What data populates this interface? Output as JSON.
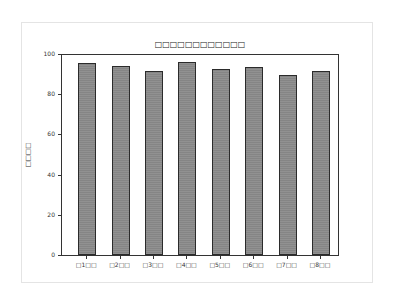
{
  "chart_data": {
    "type": "bar",
    "title": "□□□□□□□□□□□□",
    "xlabel": "",
    "ylabel": "□□□□",
    "categories": [
      "□1□□",
      "□2□□",
      "□3□□",
      "□4□□",
      "□5□□",
      "□6□□",
      "□7□□",
      "□8□□"
    ],
    "values": [
      95.4,
      94.2,
      91.4,
      96.2,
      92.4,
      93.5,
      89.8,
      91.4
    ],
    "ylim": [
      0,
      100
    ],
    "yticks": [
      "0",
      "20",
      "40",
      "60",
      "80",
      "100"
    ],
    "grid": false,
    "legend": null,
    "bar_color": "#8a8a8a",
    "edge_color": "#2b2b2b"
  }
}
